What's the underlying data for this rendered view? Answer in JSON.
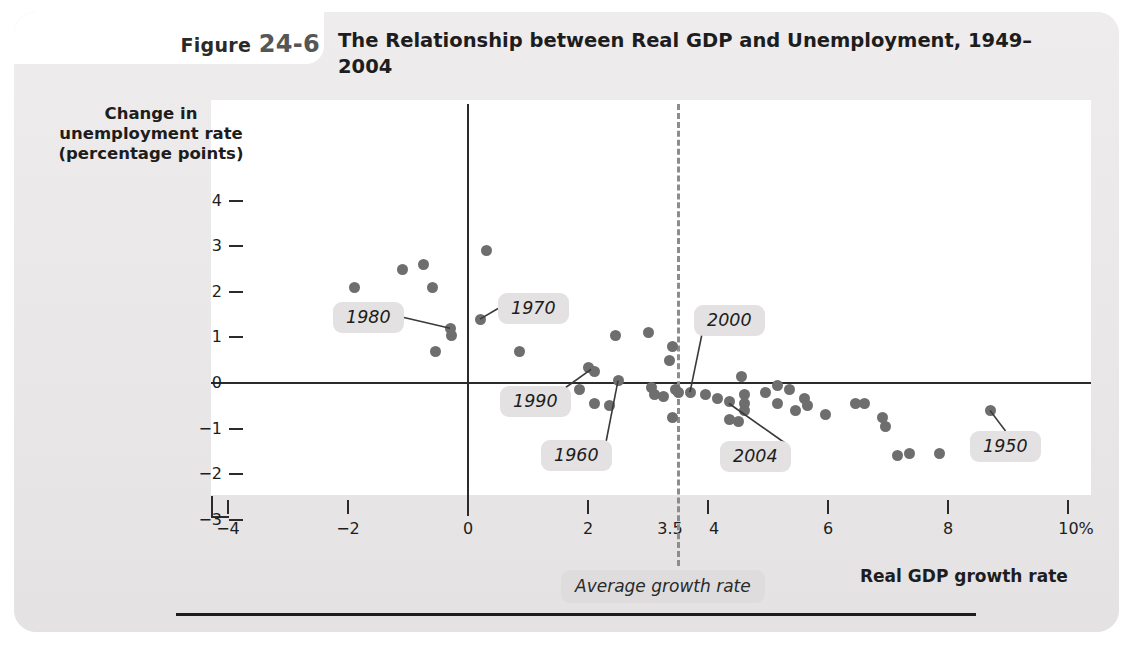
{
  "figure": {
    "label_word": "Figure",
    "label_number": "24-6",
    "title": "The Relationship between Real GDP and Unemployment, 1949–2004"
  },
  "axes": {
    "ylabel": "Change in unemployment rate (percentage points)",
    "xlabel": "Real GDP growth rate",
    "yticks": [
      "4",
      "3",
      "2",
      "1",
      "0",
      "−1",
      "−2",
      "−3"
    ],
    "ytick_values": [
      4,
      3,
      2,
      1,
      0,
      -1,
      -2,
      -3
    ],
    "xticks": [
      "−4",
      "−2",
      "0",
      "2",
      "3.5",
      "4",
      "6",
      "8",
      "10%"
    ],
    "xtick_values": [
      -4,
      -2,
      0,
      2,
      3.5,
      4,
      6,
      8,
      10
    ]
  },
  "average_line": {
    "label": "Average growth rate",
    "value": 3.5
  },
  "colors": {
    "panel": "#eceaea",
    "plot_background": "#ffffff",
    "dot": "#6e6e6e",
    "axis": "#2b2b2b",
    "callout_background": "#e3e1e1",
    "dashed_line": "#8d8d8d"
  },
  "chart_data": {
    "type": "scatter",
    "title": "The Relationship between Real GDP and Unemployment, 1949–2004",
    "xlabel": "Real GDP growth rate",
    "ylabel": "Change in unemployment rate (percentage points)",
    "xlim": [
      -4,
      10
    ],
    "ylim": [
      -3,
      4
    ],
    "grid": false,
    "legend": null,
    "reference_lines": [
      {
        "axis": "x",
        "value": 3.5,
        "style": "dashed",
        "label": "Average growth rate"
      },
      {
        "axis": "y",
        "value": 0,
        "style": "solid"
      },
      {
        "axis": "x",
        "value": 0,
        "style": "solid"
      }
    ],
    "points": [
      {
        "x": -1.9,
        "y": 2.1
      },
      {
        "x": -1.1,
        "y": 2.5
      },
      {
        "x": -0.75,
        "y": 2.6
      },
      {
        "x": -0.6,
        "y": 2.1
      },
      {
        "x": -0.3,
        "y": 1.2
      },
      {
        "x": -0.27,
        "y": 1.05
      },
      {
        "x": -0.55,
        "y": 0.7
      },
      {
        "x": 0.3,
        "y": 2.9
      },
      {
        "x": 0.2,
        "y": 1.4
      },
      {
        "x": 0.85,
        "y": 0.7
      },
      {
        "x": 2.0,
        "y": 0.35
      },
      {
        "x": 2.1,
        "y": 0.25
      },
      {
        "x": 1.85,
        "y": -0.15
      },
      {
        "x": 2.1,
        "y": -0.45
      },
      {
        "x": 2.35,
        "y": -0.5
      },
      {
        "x": 2.5,
        "y": 0.05
      },
      {
        "x": 2.45,
        "y": 1.05
      },
      {
        "x": 3.0,
        "y": 1.1
      },
      {
        "x": 3.05,
        "y": -0.1
      },
      {
        "x": 3.1,
        "y": -0.25
      },
      {
        "x": 3.25,
        "y": -0.3
      },
      {
        "x": 3.4,
        "y": 0.8
      },
      {
        "x": 3.35,
        "y": 0.5
      },
      {
        "x": 3.45,
        "y": -0.15
      },
      {
        "x": 3.5,
        "y": -0.2
      },
      {
        "x": 3.4,
        "y": -0.75
      },
      {
        "x": 3.7,
        "y": -0.2
      },
      {
        "x": 3.95,
        "y": -0.25
      },
      {
        "x": 4.15,
        "y": -0.35
      },
      {
        "x": 4.35,
        "y": -0.4
      },
      {
        "x": 4.35,
        "y": -0.8
      },
      {
        "x": 4.5,
        "y": -0.85
      },
      {
        "x": 4.55,
        "y": 0.15
      },
      {
        "x": 4.6,
        "y": -0.25
      },
      {
        "x": 4.6,
        "y": -0.45
      },
      {
        "x": 4.6,
        "y": -0.6
      },
      {
        "x": 4.95,
        "y": -0.2
      },
      {
        "x": 5.15,
        "y": -0.05
      },
      {
        "x": 5.35,
        "y": -0.15
      },
      {
        "x": 5.15,
        "y": -0.45
      },
      {
        "x": 5.45,
        "y": -0.6
      },
      {
        "x": 5.6,
        "y": -0.35
      },
      {
        "x": 5.65,
        "y": -0.5
      },
      {
        "x": 5.95,
        "y": -0.7
      },
      {
        "x": 6.45,
        "y": -0.45
      },
      {
        "x": 6.6,
        "y": -0.45
      },
      {
        "x": 6.9,
        "y": -0.75
      },
      {
        "x": 6.95,
        "y": -0.95
      },
      {
        "x": 7.15,
        "y": -1.6
      },
      {
        "x": 7.35,
        "y": -1.55
      },
      {
        "x": 7.85,
        "y": -1.55
      },
      {
        "x": 8.7,
        "y": -0.6
      }
    ],
    "annotations": [
      {
        "label": "1980",
        "point": {
          "x": -0.3,
          "y": 1.2
        }
      },
      {
        "label": "1970",
        "point": {
          "x": 0.2,
          "y": 1.4
        }
      },
      {
        "label": "1990",
        "point": {
          "x": 2.05,
          "y": 0.3
        }
      },
      {
        "label": "1960",
        "point": {
          "x": 2.5,
          "y": 0.05
        }
      },
      {
        "label": "2000",
        "point": {
          "x": 3.7,
          "y": -0.2
        }
      },
      {
        "label": "2004",
        "point": {
          "x": 4.35,
          "y": -0.45
        }
      },
      {
        "label": "1950",
        "point": {
          "x": 8.7,
          "y": -0.6
        }
      }
    ]
  }
}
